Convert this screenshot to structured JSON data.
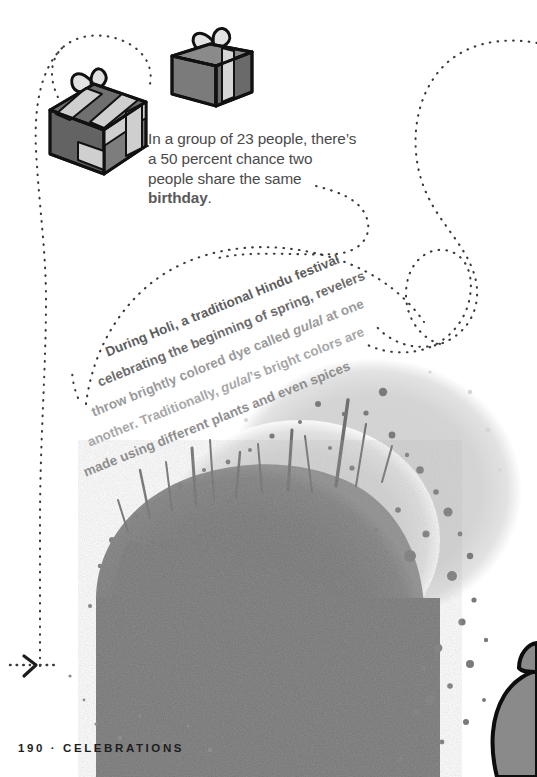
{
  "page": {
    "background_color": "#ffffff",
    "width": 537,
    "height": 777
  },
  "fact_callout": {
    "text_parts": {
      "before": "In a group of 23 people, there’s a 50 percent chance two people share the same ",
      "keyword": "birthday",
      "after": "."
    },
    "full_text": "In a group of 23 people, there’s a 50 percent chance two people share the same birthday.",
    "text_color": "#4a4a4a",
    "keyword_color": "#5a5a5a"
  },
  "holi_callout": {
    "lines": [
      "During Holi, a traditional Hindu festival",
      "celebrating the beginning of spring, revelers",
      "throw brightly colored dye called gulal at one",
      "another. Traditionally, gulal’s bright colors are",
      "made using different plants and even spices"
    ],
    "italic_words": [
      "gulal",
      "gulal’s"
    ],
    "full_text": "During Holi, a traditional Hindu festival celebrating the beginning of spring, revelers throw brightly colored dye called gulal at one another. Traditionally, gulal's bright colors are made using different plants and even spices",
    "rotation_degrees": -22,
    "line_colors": [
      "#5d5d5d",
      "#6d6d6d",
      "#9a9a9a",
      "#a8a8a8",
      "#8e8e8e"
    ]
  },
  "footer": {
    "page_number": "190",
    "separator": "·",
    "section": "CELEBRATIONS",
    "text": "190 · CELEBRATIONS",
    "color": "#1d1d1d"
  },
  "illustrations": {
    "gift_box_large": {
      "name": "gift-box-large",
      "body_color": "#6f6f6f",
      "ribbon_color": "#cfcfcf",
      "outline_color": "#111111"
    },
    "gift_box_small": {
      "name": "gift-box-small",
      "body_color": "#7b7b7b",
      "ribbon_color": "#d6d6d6",
      "outline_color": "#111111"
    },
    "paint_splatter": {
      "name": "paint-splatter",
      "dark_color": "#757575",
      "light_color": "#d3d3d3"
    },
    "figure_silhouette": {
      "name": "person-silhouette",
      "fill_color": "#8a8a8a",
      "outline_color": "#0d0d0d"
    }
  },
  "dotted_paths": {
    "dot_color": "#3a3a3a",
    "arrow_marker": ">",
    "arrow_position": {
      "x": 22,
      "y": 665
    }
  }
}
